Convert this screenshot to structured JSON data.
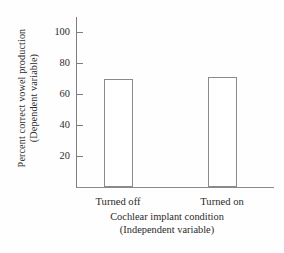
{
  "chart_data": {
    "type": "bar",
    "title": "",
    "categories": [
      "Turned off",
      "Turned on"
    ],
    "values": [
      70,
      71
    ],
    "xlabel": "Cochlear implant condition",
    "xlabel_sub": "(Independent variable)",
    "ylabel": "Percent correct vowel production",
    "ylabel_sub": "(Dependent variable)",
    "yticks": [
      20,
      40,
      60,
      80,
      100
    ],
    "ytick_labels": [
      "20",
      "40",
      "60",
      "80",
      "100"
    ],
    "ylim": [
      0,
      110
    ],
    "grid": false,
    "legend": null,
    "bar_fill_color": "#ffffff",
    "bar_edge_color": "#8a8a8a",
    "axis_color": "#7d7d7d",
    "background_color": "#fefefe",
    "text_color": "#2b2b2b"
  }
}
